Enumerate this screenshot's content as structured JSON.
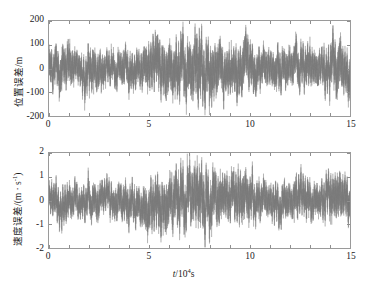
{
  "chart_data": [
    {
      "type": "line",
      "panel": "top",
      "title": "",
      "xlabel": "",
      "ylabel": "位置误差/m",
      "ylabel_parts": {
        "text": "位置误差/m",
        "quantity": "位置误差",
        "unit": "m"
      },
      "xlim": [
        0,
        15
      ],
      "ylim": [
        -200,
        200
      ],
      "xticks": [
        0,
        5,
        10,
        15
      ],
      "xticklabels": [
        "0",
        "5",
        "10",
        "15"
      ],
      "yticks": [
        -200,
        -100,
        0,
        100,
        200
      ],
      "yticklabels": [
        "-200",
        "-100",
        "0",
        "100",
        "200"
      ],
      "grid": false,
      "series": [
        {
          "name": "位置误差",
          "color": "#7a7a7a",
          "description": "高频振荡随机误差序列，均值约0，包络随时间起伏，峰值约±190 m",
          "envelope_x": [
            0.0,
            0.5,
            1.0,
            1.5,
            2.0,
            2.5,
            3.0,
            3.5,
            4.0,
            4.5,
            5.0,
            5.5,
            6.0,
            6.5,
            7.0,
            7.5,
            8.0,
            8.5,
            9.0,
            9.5,
            10.0,
            10.5,
            11.0,
            11.5,
            12.0,
            12.5,
            13.0,
            13.5,
            14.0,
            14.5,
            15.0
          ],
          "envelope_amplitude": [
            95,
            120,
            105,
            90,
            115,
            100,
            85,
            95,
            110,
            95,
            130,
            150,
            140,
            165,
            150,
            190,
            160,
            140,
            125,
            150,
            130,
            105,
            95,
            115,
            100,
            120,
            110,
            95,
            130,
            140,
            120
          ],
          "samples_per_unit": 260,
          "oscillation_period_units": 0.035
        }
      ]
    },
    {
      "type": "line",
      "panel": "bottom",
      "title": "",
      "xlabel": "t/10⁴s",
      "xlabel_parts": {
        "symbol": "t",
        "slash": "/10",
        "exponent": "4",
        "unit": "s"
      },
      "ylabel": "速度误差/(m · s⁻¹)",
      "ylabel_parts": {
        "quantity": "速度误差",
        "unit": "(m · s⁻¹)"
      },
      "xlim": [
        0,
        15
      ],
      "ylim": [
        -2,
        2
      ],
      "xticks": [
        0,
        5,
        10,
        15
      ],
      "xticklabels": [
        "0",
        "5",
        "10",
        "15"
      ],
      "yticks": [
        -2,
        -1,
        0,
        1,
        2
      ],
      "yticklabels": [
        "-2",
        "-1",
        "0",
        "1",
        "2"
      ],
      "grid": false,
      "series": [
        {
          "name": "速度误差",
          "color": "#7a7a7a",
          "description": "高频振荡随机误差序列，均值约0，峰值约±1.9 m/s，中段5-9包络最大",
          "envelope_x": [
            0.0,
            0.5,
            1.0,
            1.5,
            2.0,
            2.5,
            3.0,
            3.5,
            4.0,
            4.5,
            5.0,
            5.5,
            6.0,
            6.5,
            7.0,
            7.5,
            8.0,
            8.5,
            9.0,
            9.5,
            10.0,
            10.5,
            11.0,
            11.5,
            12.0,
            12.5,
            13.0,
            13.5,
            14.0,
            14.5,
            15.0
          ],
          "envelope_amplitude": [
            0.85,
            1.05,
            0.95,
            0.8,
            1.0,
            0.9,
            0.85,
            0.95,
            1.05,
            0.95,
            1.25,
            1.45,
            1.35,
            1.6,
            1.45,
            1.8,
            1.55,
            1.35,
            1.2,
            1.4,
            1.25,
            1.0,
            0.9,
            1.1,
            0.95,
            1.15,
            1.05,
            0.9,
            1.25,
            1.3,
            1.1
          ],
          "samples_per_unit": 260,
          "oscillation_period_units": 0.035
        }
      ]
    }
  ],
  "panels": {
    "top": {
      "name": "position-error-plot",
      "ylabel": "位置误差/m",
      "yticklabels": [
        "200",
        "100",
        "0",
        "-100",
        "-200"
      ],
      "xticklabels": [
        "0",
        "5",
        "10",
        "15"
      ]
    },
    "bottom": {
      "name": "velocity-error-plot",
      "ylabel_quantity": "速度误差",
      "ylabel_unit": "/(m · s",
      "ylabel_exp": "-1",
      "ylabel_close": ")",
      "yticklabels": [
        "2",
        "1",
        "0",
        "-1",
        "-2"
      ],
      "xticklabels": [
        "0",
        "5",
        "10",
        "15"
      ],
      "xlabel_symbol": "t",
      "xlabel_mid": "/10",
      "xlabel_exp": "4",
      "xlabel_unit": "s"
    }
  },
  "style": {
    "trace_color": "#7a7a7a",
    "frame_color": "#9a9a9a",
    "background": "#ffffff"
  }
}
